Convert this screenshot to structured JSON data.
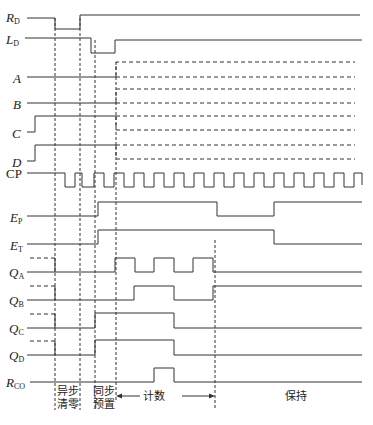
{
  "signals": [
    {
      "id": "RD",
      "main": "R",
      "sub": "D",
      "y": 18
    },
    {
      "id": "LD",
      "main": "L",
      "sub": "D",
      "y": 40
    },
    {
      "id": "A",
      "main": "A",
      "sub": "",
      "y": 77
    },
    {
      "id": "B",
      "main": "B",
      "sub": "",
      "y": 103
    },
    {
      "id": "C",
      "main": "C",
      "sub": "",
      "y": 132
    },
    {
      "id": "D",
      "main": "D",
      "sub": "",
      "y": 161
    },
    {
      "id": "CP",
      "main": "CP",
      "sub": "",
      "y": 180
    },
    {
      "id": "EP",
      "main": "E",
      "sub": "P",
      "y": 216
    },
    {
      "id": "ET",
      "main": "E",
      "sub": "T",
      "y": 244
    },
    {
      "id": "QA",
      "main": "Q",
      "sub": "A",
      "y": 272
    },
    {
      "id": "QB",
      "main": "Q",
      "sub": "B",
      "y": 300
    },
    {
      "id": "QC",
      "main": "Q",
      "sub": "C",
      "y": 328
    },
    {
      "id": "QD",
      "main": "Q",
      "sub": "D",
      "y": 355
    },
    {
      "id": "RCO",
      "main": "R",
      "sub": "CO",
      "y": 383
    }
  ],
  "annotations": {
    "async_clear": [
      "异步",
      "清零"
    ],
    "sync_preset": [
      "同步",
      "预置"
    ],
    "count": "计数",
    "hold": "保持"
  },
  "colors": {
    "line": "#333333",
    "text": "#222222",
    "background": "#ffffff"
  }
}
